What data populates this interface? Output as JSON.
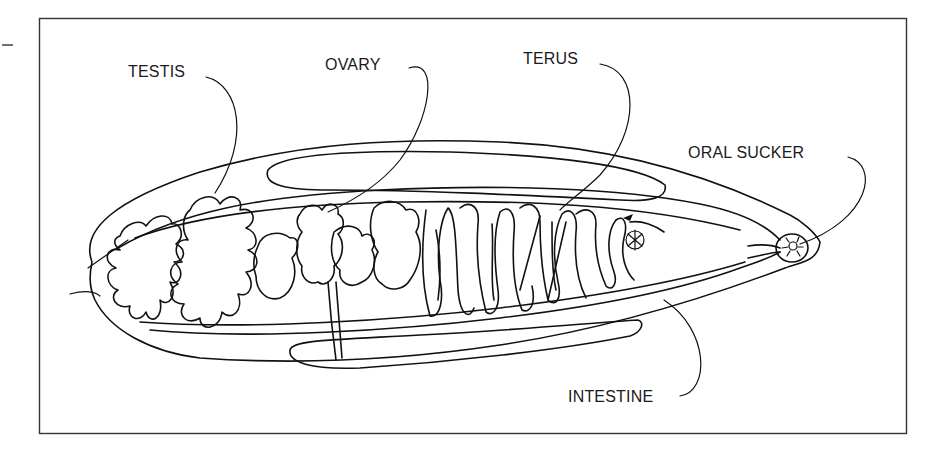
{
  "figure": {
    "labels": {
      "testis": "TESTIS",
      "ovary": "OVARY",
      "uterus": "TERUS",
      "oral_sucker": "ORAL SUCKER",
      "intestine": "INTESTINE"
    },
    "colors": {
      "line": "#111111",
      "background": "#ffffff",
      "frame": "#333333"
    }
  }
}
